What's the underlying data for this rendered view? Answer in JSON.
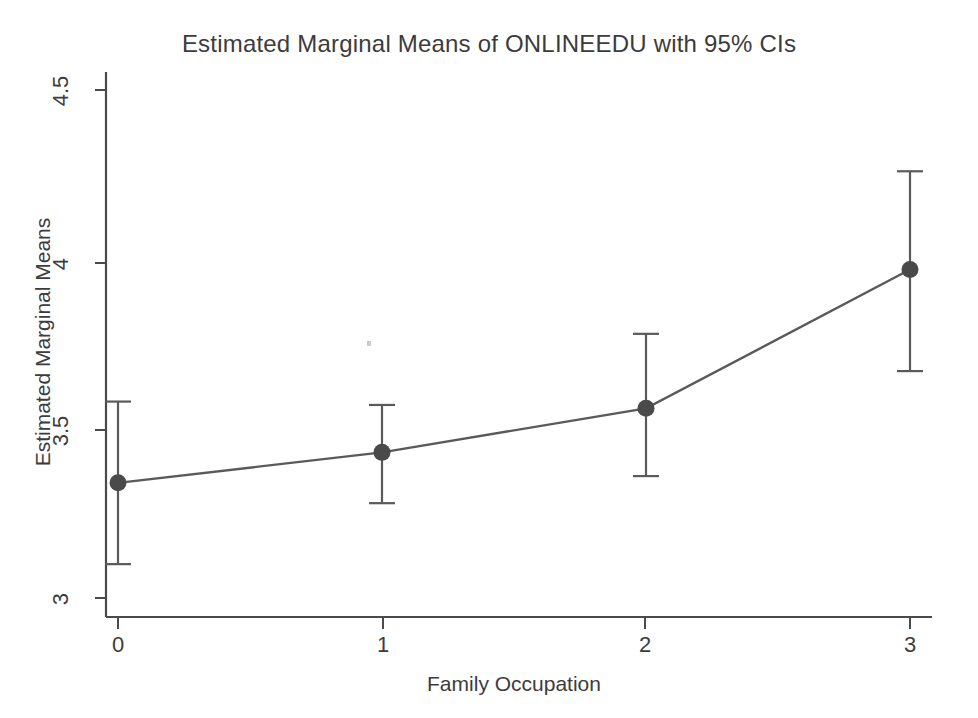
{
  "chart_data": {
    "type": "line",
    "title": "Estimated Marginal Means of ONLINEEDU with 95% CIs",
    "xlabel": "Family Occupation",
    "ylabel": "Estimated Marginal Means",
    "categories": [
      "0",
      "1",
      "2",
      "3"
    ],
    "x": [
      0,
      1,
      2,
      3
    ],
    "values": [
      3.34,
      3.43,
      3.56,
      3.97
    ],
    "ci_lower": [
      3.1,
      3.28,
      3.36,
      3.67
    ],
    "ci_upper": [
      3.58,
      3.57,
      3.78,
      4.26
    ],
    "error_bar_label": "95% CI",
    "xlim": [
      -0.08,
      3.08
    ],
    "ylim": [
      3.0,
      4.5
    ],
    "xticks": [
      "0",
      "1",
      "2",
      "3"
    ],
    "yticks": [
      "3",
      "3.5",
      "4",
      "4.5"
    ],
    "ytick_values": [
      3,
      3.5,
      4,
      4.5
    ],
    "grid": false,
    "legend": "none",
    "series": [
      {
        "name": "ONLINEEDU estimated marginal mean",
        "values": [
          3.34,
          3.43,
          3.56,
          3.97
        ]
      }
    ],
    "colors": {
      "line": "#5a5a5a",
      "marker": "#4a4a4a",
      "error_bar": "#5a5a5a",
      "axis": "#4a4a4a",
      "text": "#3c3c3c",
      "background": "#ffffff"
    }
  },
  "axes": {
    "y_ticks": [
      {
        "label": "4.5",
        "value": 4.5
      },
      {
        "label": "4",
        "value": 4
      },
      {
        "label": "3.5",
        "value": 3.5
      },
      {
        "label": "3",
        "value": 3
      }
    ],
    "x_ticks": [
      {
        "label": "0",
        "value": 0
      },
      {
        "label": "1",
        "value": 1
      },
      {
        "label": "2",
        "value": 2
      },
      {
        "label": "3",
        "value": 3
      }
    ]
  }
}
